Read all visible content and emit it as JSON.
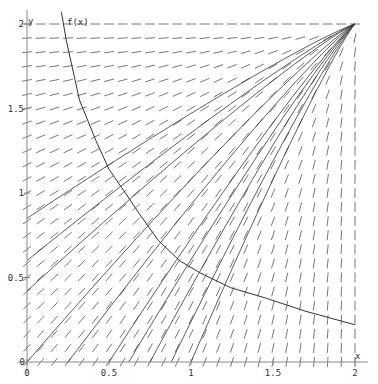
{
  "chart_data": {
    "type": "line",
    "title": "",
    "subtitle": "Slope field with solution curves and isocline f(x)",
    "xlabel": "x",
    "ylabel": "y",
    "xlim": [
      0,
      2
    ],
    "ylim": [
      0,
      2
    ],
    "grid": false,
    "legend": null,
    "x_ticks": [
      {
        "value": 0,
        "label": "0"
      },
      {
        "value": 0.5,
        "label": "0.5"
      },
      {
        "value": 1,
        "label": "1"
      },
      {
        "value": 1.5,
        "label": "1.5"
      },
      {
        "value": 2,
        "label": "2"
      }
    ],
    "y_ticks": [
      {
        "value": 0,
        "label": "0"
      },
      {
        "value": 0.5,
        "label": "0.5"
      },
      {
        "value": 1,
        "label": "1"
      },
      {
        "value": 1.5,
        "label": "1.5"
      },
      {
        "value": 2,
        "label": "2"
      }
    ],
    "annotations": [
      {
        "text": "f(x)",
        "x": 0.22,
        "y": 2.0
      }
    ],
    "slope_field": {
      "grid_steps": 24,
      "description": "short dashes whose slope points toward (2,2)",
      "convergence_point": [
        2,
        2
      ]
    },
    "series": [
      {
        "name": "f(x)",
        "x": [
          0.21,
          0.24,
          0.32,
          0.42,
          0.5,
          0.6,
          0.69,
          0.8,
          0.93,
          1.05,
          1.24,
          1.45,
          1.7,
          2.0
        ],
        "y": [
          2.07,
          1.9,
          1.55,
          1.31,
          1.14,
          1.0,
          0.87,
          0.72,
          0.6,
          0.53,
          0.44,
          0.38,
          0.3,
          0.22
        ]
      },
      {
        "name": "solution 1",
        "start": [
          0,
          0.85
        ],
        "end": [
          2,
          2
        ]
      },
      {
        "name": "solution 2",
        "start": [
          0,
          0.6
        ],
        "end": [
          2,
          2
        ]
      },
      {
        "name": "solution 3",
        "start": [
          0,
          0.42
        ],
        "end": [
          2,
          2
        ]
      },
      {
        "name": "solution 4",
        "start": [
          0,
          0.0
        ],
        "end": [
          2,
          2
        ]
      },
      {
        "name": "solution 5",
        "start": [
          0.25,
          0
        ],
        "end": [
          2,
          2
        ]
      },
      {
        "name": "solution 6",
        "start": [
          0.5,
          0
        ],
        "end": [
          2,
          2
        ]
      },
      {
        "name": "solution 7",
        "start": [
          0.62,
          0
        ],
        "end": [
          2,
          2
        ]
      },
      {
        "name": "solution 8",
        "start": [
          0.75,
          0
        ],
        "end": [
          2,
          2
        ]
      },
      {
        "name": "solution 9",
        "start": [
          0.88,
          0
        ],
        "end": [
          2,
          2
        ]
      },
      {
        "name": "solution 10",
        "start": [
          1.0,
          0
        ],
        "end": [
          2,
          2
        ]
      }
    ]
  },
  "labels": {
    "x_axis": "x",
    "y_axis": "y",
    "curve": "f(x)"
  },
  "style": {
    "axis_color": "#888888",
    "dash_color": "#555555",
    "curve_color": "#333333"
  }
}
